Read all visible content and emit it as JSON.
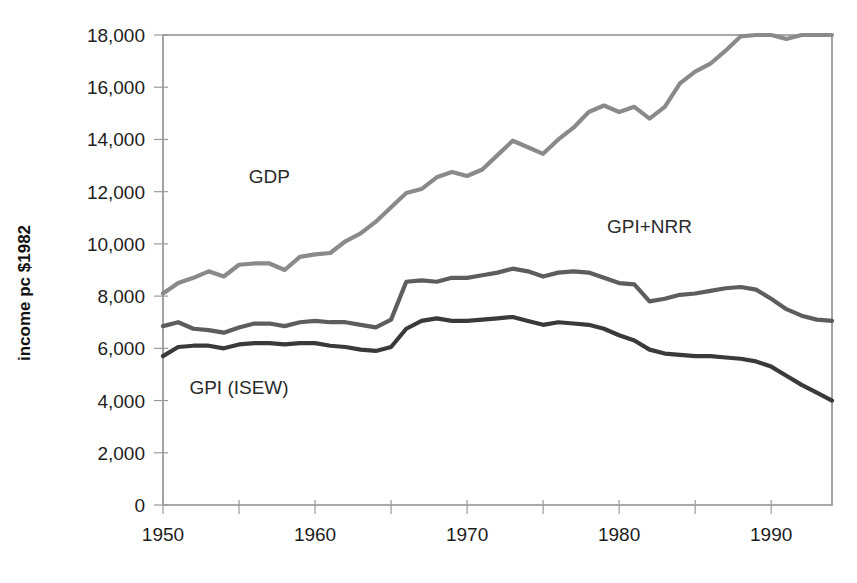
{
  "chart_data": {
    "type": "line",
    "title": "",
    "xlabel": "",
    "ylabel": "income pc $1982",
    "xlim": [
      1950,
      1994
    ],
    "ylim": [
      0,
      18000
    ],
    "grid": false,
    "legend_position": "inline-annotations",
    "x_ticks": [
      1950,
      1960,
      1970,
      1980,
      1990
    ],
    "x_tick_labels": [
      "1950",
      "1960",
      "1970",
      "1980",
      "1990"
    ],
    "x_minor_ticks": [
      1955,
      1965,
      1975,
      1985
    ],
    "y_ticks": [
      0,
      2000,
      4000,
      6000,
      8000,
      10000,
      12000,
      14000,
      16000,
      18000
    ],
    "y_tick_labels": [
      "0",
      "2,000",
      "4,000",
      "6,000",
      "8,000",
      "10,000",
      "12,000",
      "14,000",
      "16,000",
      "18,000"
    ],
    "x": [
      1950,
      1951,
      1952,
      1953,
      1954,
      1955,
      1956,
      1957,
      1958,
      1959,
      1960,
      1961,
      1962,
      1963,
      1964,
      1965,
      1966,
      1967,
      1968,
      1969,
      1970,
      1971,
      1972,
      1973,
      1974,
      1975,
      1976,
      1977,
      1978,
      1979,
      1980,
      1981,
      1982,
      1983,
      1984,
      1985,
      1986,
      1987,
      1988,
      1989,
      1990,
      1991,
      1992,
      1993,
      1994
    ],
    "series": [
      {
        "name": "GDP",
        "color": "#8a8a8a",
        "label_x": 1957,
        "label_y": 12350,
        "values": [
          8100,
          8500,
          8700,
          8950,
          8750,
          9200,
          9250,
          9250,
          9000,
          9500,
          9600,
          9650,
          10100,
          10400,
          10850,
          11400,
          11950,
          12100,
          12550,
          12750,
          12600,
          12850,
          13400,
          13950,
          13700,
          13450,
          14000,
          14450,
          15050,
          15300,
          15050,
          15250,
          14800,
          15250,
          16150,
          16600,
          16900,
          17400,
          17950,
          18250,
          18200,
          17850,
          18250,
          18600,
          19100
        ],
        "note": "pixel-traced approximate values, plotted scale capped by axis"
      },
      {
        "name": "GPI+NRR",
        "color": "#5d5d5d",
        "label_x": 1982,
        "label_y": 10400,
        "values": [
          6850,
          7000,
          6750,
          6700,
          6600,
          6800,
          6950,
          6950,
          6850,
          7000,
          7050,
          7000,
          7000,
          6900,
          6800,
          7100,
          8550,
          8600,
          8550,
          8700,
          8700,
          8800,
          8900,
          9050,
          8950,
          8750,
          8900,
          8950,
          8900,
          8700,
          8500,
          8450,
          7800,
          7900,
          8050,
          8100,
          8200,
          8300,
          8350,
          8250,
          7900,
          7500,
          7250,
          7100,
          7050
        ]
      },
      {
        "name": "GPI (ISEW)",
        "color": "#3a3a3a",
        "label_x": 1955,
        "label_y": 4250,
        "values": [
          5700,
          6050,
          6100,
          6100,
          6000,
          6150,
          6200,
          6200,
          6150,
          6200,
          6200,
          6100,
          6050,
          5950,
          5900,
          6050,
          6750,
          7050,
          7150,
          7050,
          7050,
          7100,
          7150,
          7200,
          7050,
          6900,
          7000,
          6950,
          6900,
          6750,
          6500,
          6300,
          5950,
          5800,
          5750,
          5700,
          5700,
          5650,
          5600,
          5500,
          5300,
          4950,
          4600,
          4300,
          4000
        ]
      }
    ]
  },
  "annotations": {
    "gdp_label": "GDP",
    "gpi_nrr_label": "GPI+NRR",
    "gpi_isew_label": "GPI (ISEW)"
  }
}
